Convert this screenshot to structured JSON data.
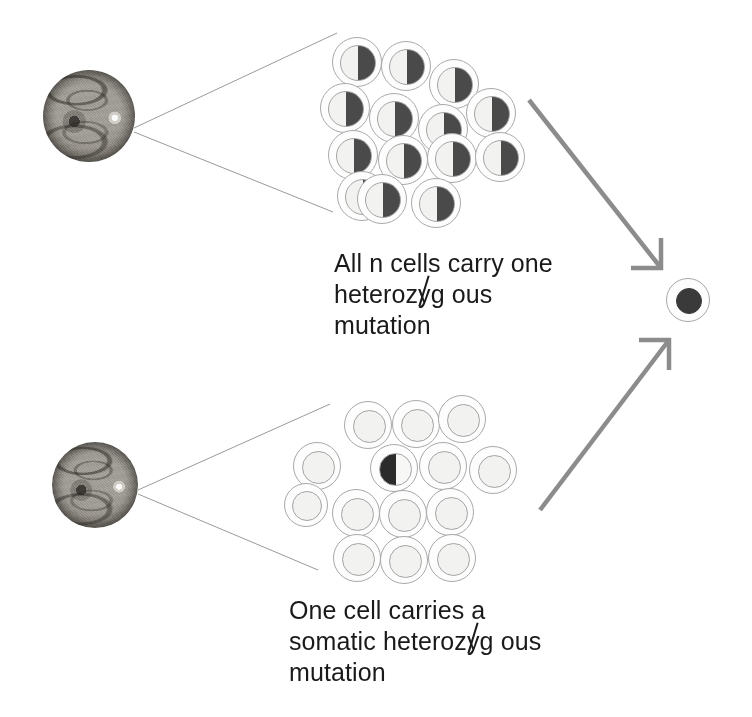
{
  "figure": {
    "background_color": "#ffffff",
    "width": 752,
    "height": 717,
    "accent_line_color": "#8c8c8c",
    "cell_outline_color": "#a9a9a9",
    "mutant_fill_color": "#3a3a3a",
    "text_color": "#1a1a1a"
  },
  "panels": [
    {
      "id": "germline",
      "eye": {
        "label": "retina-fundus-photograph",
        "cx": 89,
        "cy": 116,
        "diameter": 92
      },
      "cluster": {
        "label": "germline-cell-cluster",
        "total_cells": 15,
        "mutant_cells": 15,
        "cell_state": "heterozygous"
      },
      "caption": {
        "line1": "All n cells carry one",
        "line2_before": "heteroz",
        "line2_strike": "y",
        "line2_after": "g ous",
        "line3": "mutation",
        "plain_text": "All n cells carry one heterozygous mutation",
        "x": 334,
        "y": 248
      }
    },
    {
      "id": "somatic",
      "eye": {
        "label": "retina-fundus-photograph",
        "cx": 95,
        "cy": 485,
        "diameter": 86
      },
      "cluster": {
        "label": "somatic-cell-cluster",
        "total_cells": 15,
        "mutant_cells": 1,
        "cell_state": "wild-type"
      },
      "caption": {
        "line1": "One cell carries a",
        "line2_before": "somatic heteroz",
        "line2_strike": "y",
        "line2_after": "g ous",
        "line3": "mutation",
        "plain_text": "One cell carries a somatic heterozygous mutation",
        "x": 289,
        "y": 595
      }
    }
  ],
  "outcome": {
    "label": "homozygous-tumour-cell",
    "cx": 688,
    "cy": 300,
    "outer_diameter": 44,
    "nucleus_diameter": 26,
    "state": "homozygous"
  },
  "arrows": [
    {
      "id": "germline-to-outcome",
      "from": [
        529,
        100
      ],
      "to": [
        661,
        268
      ],
      "color": "#8c8c8c",
      "head": "corner-bracket"
    },
    {
      "id": "somatic-to-outcome",
      "from": [
        540,
        510
      ],
      "to": [
        669,
        340
      ],
      "color": "#8c8c8c",
      "head": "corner-bracket"
    }
  ],
  "leader_lines": [
    {
      "id": "germline-upper",
      "from": [
        134,
        128
      ],
      "to": [
        337,
        33
      ]
    },
    {
      "id": "germline-lower",
      "from": [
        134,
        132
      ],
      "to": [
        333,
        212
      ]
    },
    {
      "id": "somatic-upper",
      "from": [
        138,
        490
      ],
      "to": [
        330,
        404
      ]
    },
    {
      "id": "somatic-lower",
      "from": [
        138,
        494
      ],
      "to": [
        318,
        570
      ]
    }
  ],
  "germline_cells": [
    {
      "cx": 357,
      "cy": 62,
      "d": 50,
      "n": 36,
      "state": "het-right"
    },
    {
      "cx": 406,
      "cy": 66,
      "d": 50,
      "n": 36,
      "state": "het-right"
    },
    {
      "cx": 454,
      "cy": 84,
      "d": 50,
      "n": 36,
      "state": "het-right"
    },
    {
      "cx": 345,
      "cy": 108,
      "d": 50,
      "n": 36,
      "state": "het-right"
    },
    {
      "cx": 394,
      "cy": 118,
      "d": 50,
      "n": 36,
      "state": "het-right"
    },
    {
      "cx": 443,
      "cy": 129,
      "d": 50,
      "n": 36,
      "state": "het-right"
    },
    {
      "cx": 491,
      "cy": 113,
      "d": 50,
      "n": 36,
      "state": "het-right"
    },
    {
      "cx": 353,
      "cy": 155,
      "d": 50,
      "n": 36,
      "state": "het-right"
    },
    {
      "cx": 403,
      "cy": 160,
      "d": 50,
      "n": 36,
      "state": "het-right"
    },
    {
      "cx": 452,
      "cy": 158,
      "d": 50,
      "n": 36,
      "state": "het-right"
    },
    {
      "cx": 500,
      "cy": 157,
      "d": 50,
      "n": 36,
      "state": "het-right"
    },
    {
      "cx": 362,
      "cy": 196,
      "d": 50,
      "n": 36,
      "state": "het-right"
    },
    {
      "cx": 382,
      "cy": 199,
      "d": 50,
      "n": 36,
      "state": "het-right"
    },
    {
      "cx": 436,
      "cy": 203,
      "d": 50,
      "n": 36,
      "state": "het-right"
    }
  ],
  "somatic_cells": [
    {
      "cx": 368,
      "cy": 425,
      "d": 48,
      "n": 33,
      "state": "wt"
    },
    {
      "cx": 416,
      "cy": 424,
      "d": 48,
      "n": 33,
      "state": "wt"
    },
    {
      "cx": 462,
      "cy": 419,
      "d": 48,
      "n": 33,
      "state": "wt"
    },
    {
      "cx": 317,
      "cy": 466,
      "d": 48,
      "n": 33,
      "state": "wt"
    },
    {
      "cx": 394,
      "cy": 468,
      "d": 48,
      "n": 33,
      "state": "het-left"
    },
    {
      "cx": 443,
      "cy": 466,
      "d": 48,
      "n": 33,
      "state": "wt"
    },
    {
      "cx": 493,
      "cy": 470,
      "d": 48,
      "n": 33,
      "state": "wt"
    },
    {
      "cx": 306,
      "cy": 505,
      "d": 44,
      "n": 30,
      "state": "wt"
    },
    {
      "cx": 356,
      "cy": 513,
      "d": 48,
      "n": 33,
      "state": "wt"
    },
    {
      "cx": 403,
      "cy": 514,
      "d": 48,
      "n": 33,
      "state": "wt"
    },
    {
      "cx": 450,
      "cy": 512,
      "d": 48,
      "n": 33,
      "state": "wt"
    },
    {
      "cx": 357,
      "cy": 558,
      "d": 48,
      "n": 33,
      "state": "wt"
    },
    {
      "cx": 404,
      "cy": 560,
      "d": 48,
      "n": 33,
      "state": "wt"
    },
    {
      "cx": 452,
      "cy": 558,
      "d": 48,
      "n": 33,
      "state": "wt"
    }
  ]
}
